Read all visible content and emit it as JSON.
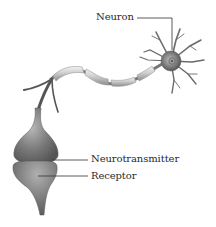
{
  "diagram": {
    "labels": {
      "neuron": "Neuron",
      "neurotransmitter": "Neurotransmitter",
      "receptor": "Receptor"
    },
    "colors": {
      "background": "#ffffff",
      "tissue_dark": "#5e5e5e",
      "tissue_mid": "#8a8a8a",
      "tissue_light": "#d6d6d6",
      "leader_line": "#333333",
      "text": "#2a2a2a"
    }
  }
}
